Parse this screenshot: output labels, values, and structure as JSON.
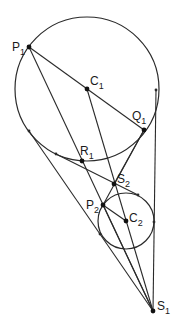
{
  "diagram": {
    "type": "geometry",
    "colors": {
      "stroke": "#2a2a2a",
      "background": "#ffffff"
    },
    "circles": [
      {
        "id": "circle1",
        "center": "C1",
        "cx": 87,
        "cy": 89,
        "r": 72
      },
      {
        "id": "circle2",
        "center": "C2",
        "cx": 126,
        "cy": 221,
        "r": 28
      }
    ],
    "points": [
      {
        "id": "P1",
        "letter": "P",
        "sub": "1",
        "x": 29,
        "y": 47,
        "lx": 12,
        "ly": 51
      },
      {
        "id": "C1",
        "letter": "C",
        "sub": "1",
        "x": 87,
        "y": 89,
        "lx": 90,
        "ly": 85
      },
      {
        "id": "Q1",
        "letter": "Q",
        "sub": "1",
        "x": 144,
        "y": 130,
        "lx": 132,
        "ly": 120
      },
      {
        "id": "R1",
        "letter": "R",
        "sub": "1",
        "x": 82,
        "y": 161,
        "lx": 80,
        "ly": 155
      },
      {
        "id": "S2",
        "letter": "S",
        "sub": "2",
        "x": 114,
        "y": 184,
        "lx": 117,
        "ly": 183
      },
      {
        "id": "P2",
        "letter": "P",
        "sub": "2",
        "x": 103,
        "y": 205,
        "lx": 86,
        "ly": 209
      },
      {
        "id": "C2",
        "letter": "C",
        "sub": "2",
        "x": 126,
        "y": 221,
        "lx": 129,
        "ly": 222
      },
      {
        "id": "S1",
        "letter": "S",
        "sub": "1",
        "x": 153,
        "y": 311,
        "lx": 157,
        "ly": 310
      }
    ],
    "tangent_points": [
      {
        "x": 156,
        "y": 90
      },
      {
        "x": 29,
        "y": 131
      },
      {
        "x": 56,
        "y": 154
      },
      {
        "x": 138,
        "y": 195
      },
      {
        "x": 100,
        "y": 234
      },
      {
        "x": 154,
        "y": 222
      }
    ],
    "segments": [
      {
        "from": [
          29,
          47
        ],
        "to": [
          144,
          130
        ]
      },
      {
        "from": [
          29,
          47
        ],
        "to": [
          153,
          311
        ]
      },
      {
        "from": [
          87,
          89
        ],
        "to": [
          153,
          311
        ]
      },
      {
        "from": [
          144,
          130
        ],
        "to": [
          103,
          205
        ]
      },
      {
        "from": [
          156,
          90
        ],
        "to": [
          153,
          311
        ]
      },
      {
        "from": [
          29,
          131
        ],
        "to": [
          153,
          311
        ]
      },
      {
        "from": [
          56,
          154
        ],
        "to": [
          138,
          195
        ]
      },
      {
        "from": [
          103,
          205
        ],
        "to": [
          126,
          221
        ]
      },
      {
        "from": [
          103,
          205
        ],
        "to": [
          153,
          311
        ]
      },
      {
        "from": [
          144,
          130
        ],
        "to": [
          114,
          184
        ]
      }
    ]
  }
}
